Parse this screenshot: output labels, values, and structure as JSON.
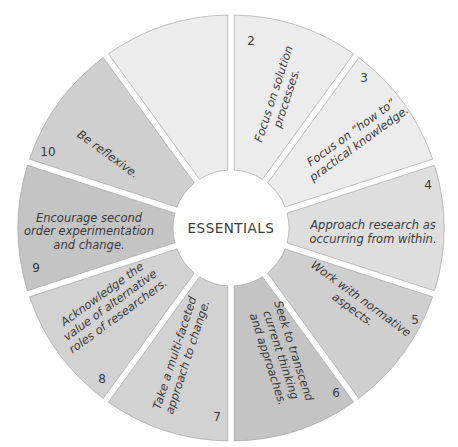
{
  "center": {
    "label": "ESSENTIALS"
  },
  "segments": [
    {
      "number": "1",
      "lines": [
        "Focus on",
        "transformations."
      ],
      "fill": "#ececec"
    },
    {
      "number": "2",
      "lines": [
        "Focus on solution",
        "processes."
      ],
      "fill": "#ececec"
    },
    {
      "number": "3",
      "lines": [
        "Focus on “how to”",
        "practical knowledge."
      ],
      "fill": "#dedede"
    },
    {
      "number": "4",
      "lines": [
        "Approach research as",
        "occurring from within."
      ],
      "fill": "#cfcfcf"
    },
    {
      "number": "5",
      "lines": [
        "Work with normative",
        "aspects."
      ],
      "fill": "#c4c4c4"
    },
    {
      "number": "6",
      "lines": [
        "Seek to transcend",
        "current thinking",
        "and approaches."
      ],
      "fill": "#d2d2d2"
    },
    {
      "number": "7",
      "lines": [
        "Take a multi-faceted",
        "approach to change."
      ],
      "fill": "#d2d2d2"
    },
    {
      "number": "8",
      "lines": [
        "Acknowledge the",
        "value of alternative",
        "roles of researchers."
      ],
      "fill": "#c4c4c4"
    },
    {
      "number": "9",
      "lines": [
        "Encourage second",
        "order experimentation",
        "and change."
      ],
      "fill": "#cfcfcf"
    },
    {
      "number": "10",
      "lines": [
        "Be reflexive."
      ],
      "fill": "#ececec"
    }
  ]
}
